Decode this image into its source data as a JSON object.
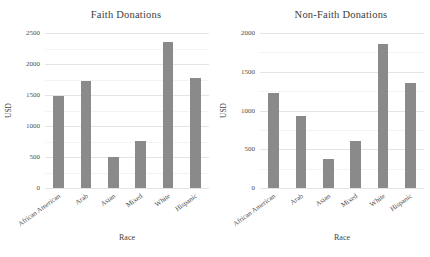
{
  "page": {
    "background": "#ffffff"
  },
  "styles": {
    "bar_color": "#8a8a8a",
    "grid_major_color": "#e4e4e4",
    "grid_minor_color": "#f3f3f3",
    "text_color": "#454545",
    "tick_text_color": "#4d4d4d"
  },
  "chart_data": [
    {
      "type": "bar",
      "title": "Faith Donations",
      "xlabel": "Race",
      "ylabel": "USD",
      "categories": [
        "African American",
        "Arab",
        "Asian",
        "Mixed",
        "White",
        "Hispanic"
      ],
      "values": [
        1480,
        1720,
        500,
        755,
        2350,
        1770
      ],
      "ylim": [
        0,
        2500
      ],
      "yticks": [
        0,
        500,
        1000,
        1500,
        2000,
        2500
      ],
      "minor_tick_interval": 250,
      "grid": "on",
      "legend": "none",
      "x_tick_rotation_deg": 36
    },
    {
      "type": "bar",
      "title": "Non-Faith Donations",
      "xlabel": "Race",
      "ylabel": "USD",
      "categories": [
        "African American",
        "Arab",
        "Asian",
        "Mixed",
        "White",
        "Hispanic"
      ],
      "values": [
        1230,
        930,
        375,
        610,
        1860,
        1360
      ],
      "ylim": [
        0,
        2000
      ],
      "yticks": [
        0,
        500,
        1000,
        1500,
        2000
      ],
      "minor_tick_interval": 250,
      "grid": "on",
      "legend": "none",
      "x_tick_rotation_deg": 36
    }
  ]
}
